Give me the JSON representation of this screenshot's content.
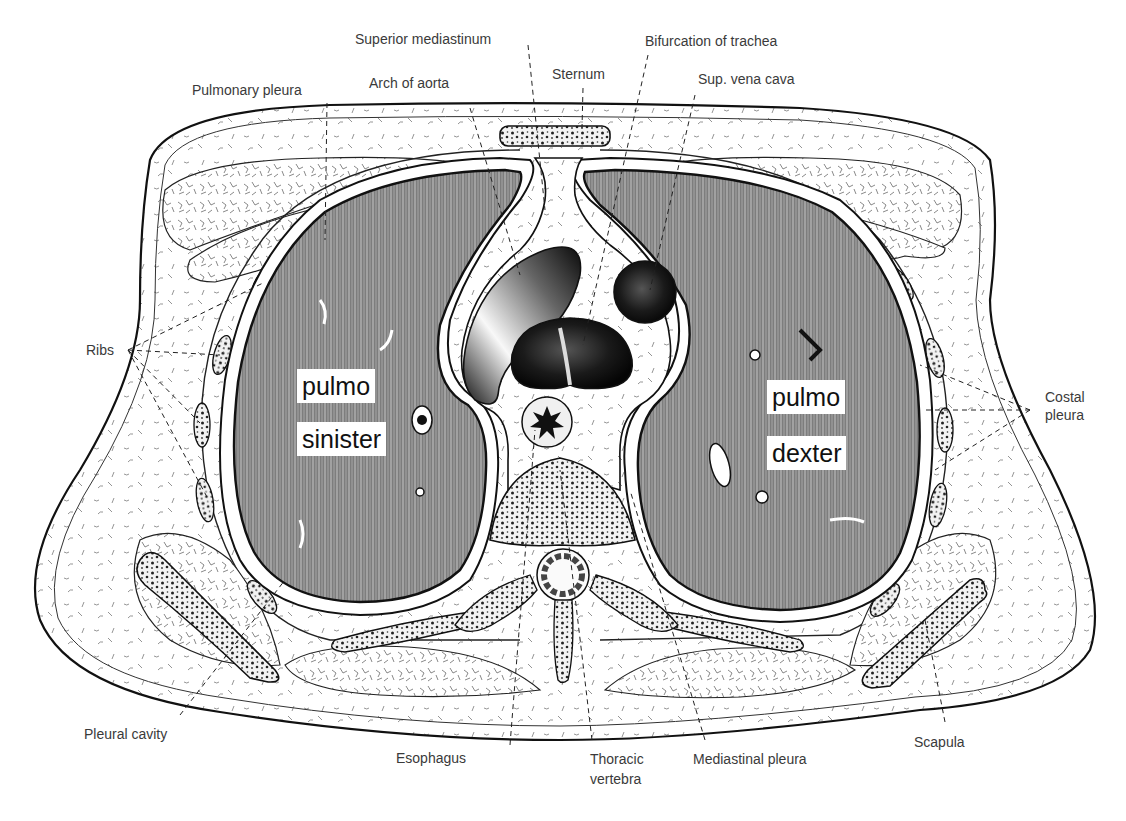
{
  "figure": {
    "type": "anatomical-cross-section",
    "colors": {
      "background": "#ffffff",
      "ink": "#111111",
      "label_text": "#3a3a3a",
      "lung_fill": "#8a8a8a",
      "tissue_fill": "#f4f4f4"
    }
  },
  "lung_labels": {
    "left_line1": "pulmo",
    "left_line2": "sinister",
    "right_line1": "pulmo",
    "right_line2": "dexter"
  },
  "labels": {
    "superior_mediastinum": "Superior mediastinum",
    "bifurcation_of_trachea": "Bifurcation of trachea",
    "pulmonary_pleura": "Pulmonary pleura",
    "arch_of_aorta": "Arch of aorta",
    "sternum": "Sternum",
    "sup_vena_cava": "Sup. vena cava",
    "ribs": "Ribs",
    "costal_pleura_line1": "Costal",
    "costal_pleura_line2": "pleura",
    "pleural_cavity": "Pleural cavity",
    "esophagus": "Esophagus",
    "thoracic_vertebra_line1": "Thoracic",
    "thoracic_vertebra_line2": "vertebra",
    "mediastinal_pleura": "Mediastinal pleura",
    "scapula": "Scapula"
  }
}
